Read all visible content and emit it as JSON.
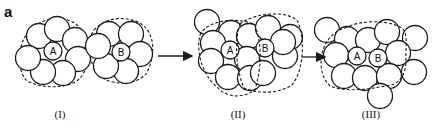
{
  "figure": {
    "label": "a",
    "stroke_color": "#1a1a1a",
    "background": "#ffffff"
  },
  "panels": [
    {
      "id": "I",
      "label": "(I)",
      "label_pos": [
        60,
        118
      ],
      "clusters": [
        {
          "center_label": "A",
          "center": [
            53,
            51
          ],
          "center_r": 9,
          "neighbors": [
            [
              39,
              36
            ],
            [
              57,
              29
            ],
            [
              75,
              40
            ],
            [
              78,
              59
            ],
            [
              63,
              73
            ],
            [
              43,
              72
            ],
            [
              28,
              58
            ]
          ],
          "boundary": "M 30 30 C 45 15, 70 15, 80 28 C 88 45, 92 68, 78 80 C 65 90, 38 88, 26 80 C 16 68, 18 42, 30 30 Z"
        },
        {
          "center_label": "B",
          "center": [
            121,
            52
          ],
          "center_r": 9,
          "neighbors": [
            [
              109,
              34
            ],
            [
              131,
              34
            ],
            [
              140,
              54
            ],
            [
              126,
              71
            ],
            [
              106,
              66
            ],
            [
              98,
              46
            ]
          ],
          "boundary": "M 94 30 C 108 14, 135 16, 146 28 C 156 40, 154 60, 146 74 C 135 86, 108 86, 98 74 C 88 60, 86 42, 94 30 Z"
        }
      ]
    },
    {
      "id": "II",
      "label": "(II)",
      "label_pos": [
        238,
        118
      ],
      "center_atoms": [
        {
          "label": "A",
          "pos": [
            230,
            50
          ],
          "r": 9
        },
        {
          "label": "B",
          "pos": [
            265,
            48
          ],
          "r": 9
        }
      ],
      "atoms": [
        [
          207,
          22
        ],
        [
          231,
          33
        ],
        [
          213,
          43
        ],
        [
          249,
          36
        ],
        [
          268,
          28
        ],
        [
          290,
          37
        ],
        [
          211,
          61
        ],
        [
          228,
          77
        ],
        [
          247,
          59
        ],
        [
          250,
          78
        ],
        [
          263,
          73
        ],
        [
          285,
          56
        ],
        [
          283,
          42
        ]
      ],
      "boundaries": [
        "M 200 35 C 205 22, 235 15, 255 25 C 262 45, 262 65, 255 90 C 240 100, 225 96, 218 88 C 205 78, 195 55, 200 35 Z",
        "M 240 24 C 255 12, 290 10, 298 22 C 305 40, 304 70, 292 85 C 278 94, 258 94, 244 88 C 236 70, 234 40, 240 24 Z"
      ]
    },
    {
      "id": "III",
      "label": "(III)",
      "label_pos": [
        371,
        118
      ],
      "center_atoms": [
        {
          "label": "A",
          "pos": [
            357,
            56
          ],
          "r": 9
        },
        {
          "label": "B",
          "pos": [
            378,
            58
          ],
          "r": 9
        }
      ],
      "atoms": [
        [
          327,
          30
        ],
        [
          347,
          39
        ],
        [
          368,
          40
        ],
        [
          387,
          32
        ],
        [
          415,
          38
        ],
        [
          336,
          55
        ],
        [
          398,
          53
        ],
        [
          344,
          76
        ],
        [
          365,
          78
        ],
        [
          389,
          76
        ],
        [
          414,
          72
        ],
        [
          380,
          96
        ]
      ],
      "boundary": "M 345 28 C 360 20, 385 20, 398 26 C 410 30, 405 45, 406 62 C 405 80, 395 86, 385 86 C 365 90, 345 92, 330 86 C 318 75, 320 55, 325 45 C 330 35, 338 30, 345 28 Z"
    }
  ],
  "arrows": [
    {
      "from": [
        158,
        56
      ],
      "to": [
        192,
        56
      ]
    },
    {
      "from": [
        302,
        57
      ],
      "to": [
        325,
        57
      ]
    }
  ],
  "atom_radius": 12.5
}
